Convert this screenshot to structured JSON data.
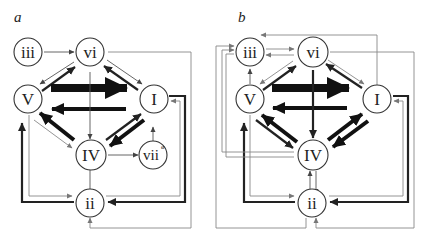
{
  "figure": {
    "type": "chord-transition-network",
    "panels": [
      {
        "id": "a",
        "label": "a",
        "nodes": [
          {
            "id": "iii",
            "label": "iii"
          },
          {
            "id": "vi",
            "label": "vi"
          },
          {
            "id": "V",
            "label": "V"
          },
          {
            "id": "I",
            "label": "I"
          },
          {
            "id": "IV",
            "label": "IV"
          },
          {
            "id": "vii0",
            "label": "vii",
            "superscript": "ø"
          },
          {
            "id": "ii",
            "label": "ii"
          }
        ],
        "edges": [
          {
            "from": "iii",
            "to": "vi",
            "weight": "thin"
          },
          {
            "from": "vi",
            "to": "V",
            "weight": "thin"
          },
          {
            "from": "V",
            "to": "vi",
            "weight": "medium"
          },
          {
            "from": "vi",
            "to": "I",
            "weight": "thin"
          },
          {
            "from": "I",
            "to": "vi",
            "weight": "medium"
          },
          {
            "from": "V",
            "to": "I",
            "weight": "very-thick"
          },
          {
            "from": "I",
            "to": "V",
            "weight": "thick"
          },
          {
            "from": "vi",
            "to": "IV",
            "weight": "thin"
          },
          {
            "from": "IV",
            "to": "V",
            "weight": "thick"
          },
          {
            "from": "V",
            "to": "IV",
            "weight": "thin"
          },
          {
            "from": "IV",
            "to": "I",
            "weight": "medium"
          },
          {
            "from": "I",
            "to": "IV",
            "weight": "thick"
          },
          {
            "from": "IV",
            "to": "vii0",
            "weight": "thin"
          },
          {
            "from": "vii0",
            "to": "I",
            "weight": "thin"
          },
          {
            "from": "IV",
            "to": "ii",
            "weight": "thin"
          },
          {
            "from": "ii",
            "to": "V",
            "weight": "thick"
          },
          {
            "from": "V",
            "to": "ii",
            "weight": "thin"
          },
          {
            "from": "I",
            "to": "ii",
            "weight": "medium"
          },
          {
            "from": "ii",
            "to": "I",
            "weight": "thin"
          },
          {
            "from": "vi",
            "to": "ii",
            "weight": "thin"
          }
        ]
      },
      {
        "id": "b",
        "label": "b",
        "nodes": [
          {
            "id": "iii",
            "label": "iii"
          },
          {
            "id": "vi",
            "label": "vi"
          },
          {
            "id": "V",
            "label": "V"
          },
          {
            "id": "I",
            "label": "I"
          },
          {
            "id": "IV",
            "label": "IV"
          },
          {
            "id": "ii",
            "label": "ii"
          }
        ],
        "edges": [
          {
            "from": "iii",
            "to": "vi",
            "weight": "thin"
          },
          {
            "from": "vi",
            "to": "iii",
            "weight": "thin"
          },
          {
            "from": "I",
            "to": "iii",
            "weight": "thin"
          },
          {
            "from": "V",
            "to": "iii",
            "weight": "thin"
          },
          {
            "from": "vi",
            "to": "V",
            "weight": "thin"
          },
          {
            "from": "V",
            "to": "vi",
            "weight": "medium"
          },
          {
            "from": "vi",
            "to": "I",
            "weight": "thin"
          },
          {
            "from": "I",
            "to": "vi",
            "weight": "medium"
          },
          {
            "from": "V",
            "to": "I",
            "weight": "very-thick"
          },
          {
            "from": "I",
            "to": "V",
            "weight": "thick"
          },
          {
            "from": "vi",
            "to": "IV",
            "weight": "medium"
          },
          {
            "from": "IV",
            "to": "V",
            "weight": "thick"
          },
          {
            "from": "V",
            "to": "IV",
            "weight": "medium"
          },
          {
            "from": "IV",
            "to": "I",
            "weight": "thick"
          },
          {
            "from": "I",
            "to": "IV",
            "weight": "thick"
          },
          {
            "from": "IV",
            "to": "ii",
            "weight": "thin"
          },
          {
            "from": "ii",
            "to": "IV",
            "weight": "thin"
          },
          {
            "from": "ii",
            "to": "V",
            "weight": "thick"
          },
          {
            "from": "V",
            "to": "ii",
            "weight": "thin"
          },
          {
            "from": "I",
            "to": "ii",
            "weight": "medium"
          },
          {
            "from": "ii",
            "to": "I",
            "weight": "thin"
          },
          {
            "from": "vi",
            "to": "ii",
            "weight": "thin"
          },
          {
            "from": "IV",
            "to": "iii",
            "weight": "thin"
          },
          {
            "from": "ii",
            "to": "iii",
            "weight": "thin"
          }
        ]
      }
    ]
  }
}
